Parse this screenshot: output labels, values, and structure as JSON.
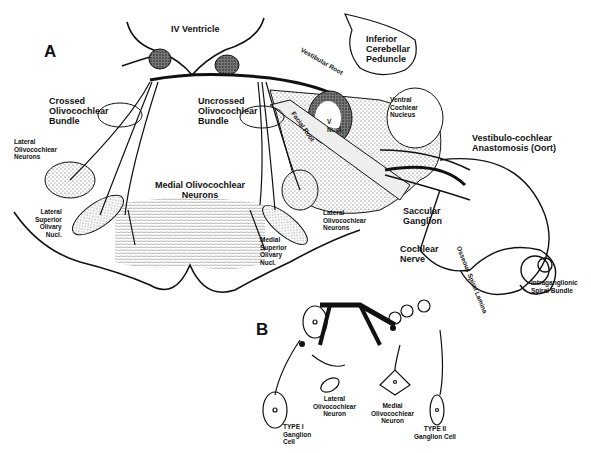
{
  "figure": {
    "panel_a": {
      "letter": "A",
      "labels": {
        "iv_ventricle": "IV Ventricle",
        "inferior_cerebellar_peduncle": "Inferior\nCerebellar\nPeduncle",
        "vestibular_root": "Vestibular Root",
        "crossed_bundle": "Crossed\nOlivocochlear\nBundle",
        "uncrossed_bundle": "Uncrossed\nOlivocochlear\nBundle",
        "facial_root": "Facial Root",
        "v_nucl": "V\nNucl.",
        "ventral_cochlear_nucleus": "Ventral\nCochlear\nNucleus",
        "vestibulo_cochlear_anastomosis": "Vestibulo-cochlear\nAnastomosis (Oort)",
        "lateral_oc_neurons_left": "Lateral\nOlivocochlear\nNeurons",
        "lateral_superior_olivary_nucl": "Lateral\nSuperior\nOlivary\nNucl.",
        "medial_oc_neurons": "Medial Olivocochlear\nNeurons",
        "lateral_oc_neurons_right": "Lateral\nOlivocochlear\nNeurons",
        "medial_superior_olivary_nucl": "Medial\nSuperior\nOlivary\nNucl.",
        "saccular_ganglion": "Saccular\nGanglion",
        "cochlear_nerve": "Cochlear\nNerve",
        "osseous_spiral_lamina": "Osseous Spiral Lamina",
        "intraganglionic_spiral_bundle": "Intraganglionic\nSpiral Bundle"
      }
    },
    "panel_b": {
      "letter": "B",
      "labels": {
        "type_i": "TYPE I\nGanglion\nCell",
        "lateral_oc_neuron": "Lateral\nOlivocochlear\nNeuron",
        "medial_oc_neuron": "Medial\nOlivocochlear\nNeuron",
        "type_ii": "TYPE II\nGanglion Cell"
      }
    }
  }
}
